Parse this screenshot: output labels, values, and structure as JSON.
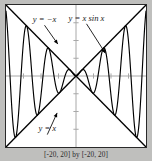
{
  "figure": {
    "caption": "[-20, 20] by [-20, 20]",
    "background_color": "#bfbfbd",
    "plot_background": "#ffffff",
    "frame_color": "#2a2a2a"
  },
  "labels": {
    "envelope_upper": "y = −x",
    "envelope_lower": "y = x",
    "curve": "y = x sin x"
  },
  "chart_data": {
    "type": "line",
    "title": "",
    "subtitle": "",
    "xlabel": "",
    "ylabel": "",
    "xlim": [
      -20,
      20
    ],
    "ylim": [
      -20,
      20
    ],
    "grid": false,
    "legend": "none",
    "axis_color": "#a8a8a8",
    "curve_color": "#000000",
    "envelope_color": "#000000",
    "x_ticks": [
      -20,
      -15,
      -10,
      -5,
      0,
      5,
      10,
      15,
      20
    ],
    "y_ticks": [
      -20,
      -15,
      -10,
      -5,
      0,
      5,
      10,
      15,
      20
    ],
    "tick_labels_shown": false,
    "annotations": [
      {
        "text": "y = −x",
        "x": -9.0,
        "y": 15.2,
        "points_to": [
          -5.2,
          9.0
        ]
      },
      {
        "text": "y = x sin x",
        "x": 3.0,
        "y": 15.6,
        "points_to": [
          8.4,
          6.4
        ]
      },
      {
        "text": "y = x",
        "x": -8.2,
        "y": -15.6,
        "points_to": [
          -5.4,
          -10.4
        ]
      }
    ],
    "series": [
      {
        "name": "y = x sin x",
        "type": "oscillating",
        "expression": "x*sin(x)",
        "samples": 1400,
        "x_range": [
          -20,
          20
        ]
      },
      {
        "name": "y = x",
        "type": "envelope",
        "expression": "x",
        "points": [
          [
            -20,
            -20
          ],
          [
            20,
            20
          ]
        ]
      },
      {
        "name": "y = -x",
        "type": "envelope",
        "expression": "-x",
        "points": [
          [
            -20,
            20
          ],
          [
            20,
            -20
          ]
        ]
      }
    ]
  }
}
